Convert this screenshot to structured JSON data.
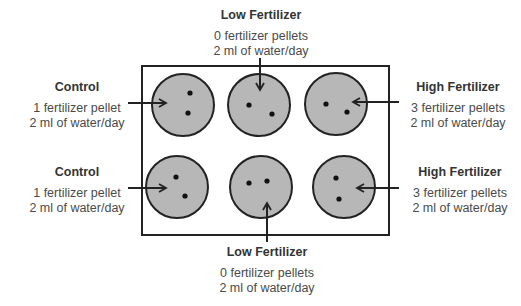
{
  "diagram": {
    "tray": {
      "x": 142,
      "y": 66,
      "width": 247,
      "height": 169,
      "stroke": "#222222"
    },
    "well_fill": "#b7b7b7",
    "well_stroke": "#222222",
    "pellet_color": "#111111",
    "wells": [
      {
        "id": "top-left",
        "group": "Control",
        "cx": 183,
        "cy": 105,
        "r": 31,
        "pellets": [
          [
            190,
            93
          ],
          [
            188,
            113
          ]
        ]
      },
      {
        "id": "top-middle",
        "group": "Low Fertilizer",
        "cx": 259,
        "cy": 105,
        "r": 31,
        "pellets": [
          [
            249,
            105
          ],
          [
            272,
            114
          ]
        ]
      },
      {
        "id": "top-right",
        "group": "High Fertilizer",
        "cx": 336,
        "cy": 104,
        "r": 31,
        "pellets": [
          [
            326,
            104
          ],
          [
            347,
            112
          ]
        ]
      },
      {
        "id": "bottom-left",
        "group": "Control",
        "cx": 177,
        "cy": 187,
        "r": 31,
        "pellets": [
          [
            176,
            177
          ],
          [
            185,
            196
          ]
        ]
      },
      {
        "id": "bottom-middle",
        "group": "Low Fertilizer",
        "cx": 261,
        "cy": 187,
        "r": 31,
        "pellets": [
          [
            249,
            183
          ],
          [
            267,
            181
          ]
        ]
      },
      {
        "id": "bottom-right",
        "group": "High Fertilizer",
        "cx": 344,
        "cy": 187,
        "r": 31,
        "pellets": [
          [
            336,
            178
          ],
          [
            339,
            199
          ]
        ]
      }
    ]
  },
  "labels": {
    "top_left": {
      "title": "Control",
      "line1": "1 fertilizer pellet",
      "line2": "2 ml of water/day"
    },
    "top_middle": {
      "title": "Low Fertilizer",
      "line1": "0 fertilizer pellets",
      "line2": "2 ml of water/day"
    },
    "top_right": {
      "title": "High Fertilizer",
      "line1": "3 fertilizer pellets",
      "line2": "2 ml of water/day"
    },
    "bottom_left": {
      "title": "Control",
      "line1": "1 fertilizer pellet",
      "line2": "2 ml of water/day"
    },
    "bottom_middle": {
      "title": "Low Fertilizer",
      "line1": "0 fertilizer pellets",
      "line2": "2 ml of water/day"
    },
    "bottom_right": {
      "title": "High Fertilizer",
      "line1": "3 fertilizer pellets",
      "line2": "2 ml of water/day"
    }
  }
}
